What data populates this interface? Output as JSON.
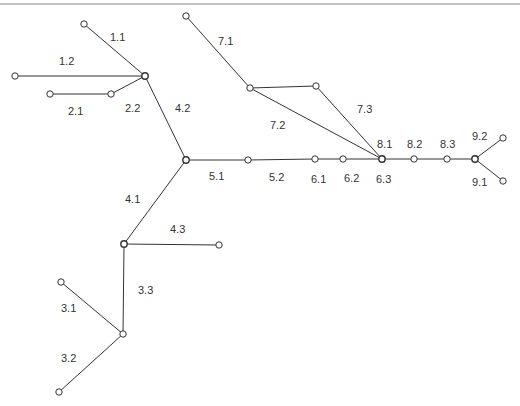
{
  "diagram": {
    "type": "network-tree",
    "nodes": [
      {
        "id": "A",
        "role": "hub"
      },
      {
        "id": "n11",
        "role": "leaf"
      },
      {
        "id": "n12",
        "role": "leaf"
      },
      {
        "id": "n21",
        "role": "leaf"
      },
      {
        "id": "n22",
        "role": "junction"
      },
      {
        "id": "B",
        "role": "hub"
      },
      {
        "id": "n51",
        "role": "junction"
      },
      {
        "id": "n61",
        "role": "junction"
      },
      {
        "id": "n62",
        "role": "junction"
      },
      {
        "id": "D",
        "role": "hub"
      },
      {
        "id": "n82",
        "role": "junction"
      },
      {
        "id": "n83",
        "role": "junction"
      },
      {
        "id": "E",
        "role": "hub"
      },
      {
        "id": "n92",
        "role": "leaf"
      },
      {
        "id": "n91",
        "role": "leaf"
      },
      {
        "id": "n71",
        "role": "leaf"
      },
      {
        "id": "F",
        "role": "junction"
      },
      {
        "id": "n73",
        "role": "junction"
      },
      {
        "id": "C",
        "role": "hub"
      },
      {
        "id": "n43",
        "role": "leaf"
      },
      {
        "id": "G",
        "role": "junction"
      },
      {
        "id": "n31",
        "role": "leaf"
      },
      {
        "id": "n32",
        "role": "leaf"
      }
    ],
    "edges": [
      {
        "from": "n11",
        "to": "A"
      },
      {
        "from": "n12",
        "to": "A"
      },
      {
        "from": "n21",
        "to": "n22"
      },
      {
        "from": "n22",
        "to": "A"
      },
      {
        "from": "A",
        "to": "B"
      },
      {
        "from": "B",
        "to": "n51"
      },
      {
        "from": "n51",
        "to": "n61"
      },
      {
        "from": "n61",
        "to": "n62"
      },
      {
        "from": "n62",
        "to": "D"
      },
      {
        "from": "D",
        "to": "n82"
      },
      {
        "from": "n82",
        "to": "n83"
      },
      {
        "from": "n83",
        "to": "E"
      },
      {
        "from": "E",
        "to": "n92"
      },
      {
        "from": "E",
        "to": "n91"
      },
      {
        "from": "n71",
        "to": "F"
      },
      {
        "from": "F",
        "to": "n73"
      },
      {
        "from": "F",
        "to": "D"
      },
      {
        "from": "n73",
        "to": "D"
      },
      {
        "from": "B",
        "to": "C"
      },
      {
        "from": "C",
        "to": "n43"
      },
      {
        "from": "C",
        "to": "G"
      },
      {
        "from": "n31",
        "to": "G"
      },
      {
        "from": "n32",
        "to": "G"
      }
    ],
    "labels": [
      "1.1",
      "1.2",
      "2.1",
      "2.2",
      "4.2",
      "7.1",
      "7.2",
      "7.3",
      "5.1",
      "5.2",
      "6.1",
      "6.2",
      "6.3",
      "8.1",
      "8.2",
      "8.3",
      "9.2",
      "9.1",
      "4.1",
      "4.3",
      "3.3",
      "3.1",
      "3.2"
    ]
  }
}
